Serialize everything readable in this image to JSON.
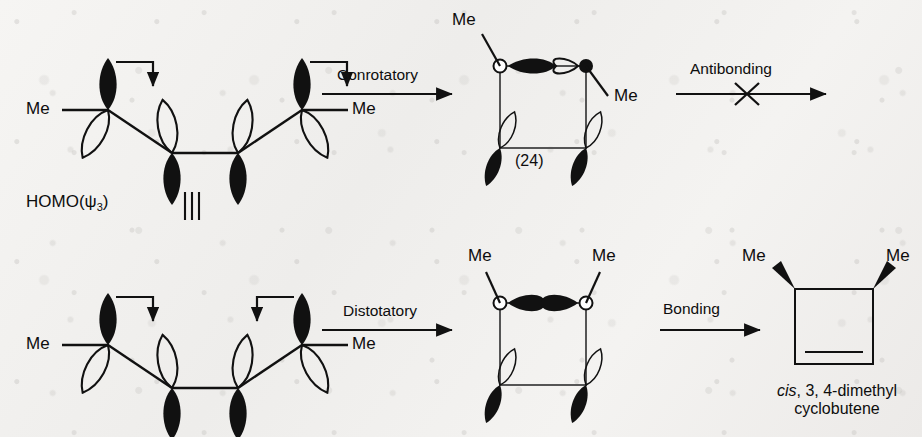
{
  "diagram": {
    "background_color": "#f3f2f0",
    "ink_color": "#111111"
  },
  "labels": {
    "homo": "HOMO(ψ",
    "homo_sub": "3",
    "homo_close": ")",
    "equals_sign": "‖",
    "me": "Me",
    "compound_24": "(24)"
  },
  "rows": [
    {
      "id": "conrotatory-row",
      "rotation_mode": "conrotatory",
      "reactant": {
        "name": "hexadiene-homo-conrotatory",
        "left_methyl": "Me",
        "right_methyl": "Me",
        "arrow_direction_left": "clockwise-right-down",
        "arrow_direction_right": "clockwise-right-down"
      },
      "arrow1_label": "Conrotatory",
      "intermediate": {
        "name": "transition-structure-24",
        "caption": "(24)",
        "top_left_methyl": "Me",
        "top_right_methyl": "Me",
        "overlap": "antibonding"
      },
      "arrow2_label": "Antibonding",
      "arrow2_blocked": true,
      "product": null
    },
    {
      "id": "disrotatory-row",
      "rotation_mode": "disrotatory",
      "reactant": {
        "name": "hexadiene-homo-disrotatory",
        "left_methyl": "Me",
        "right_methyl": "Me",
        "arrow_direction_left": "right-down-inward",
        "arrow_direction_right": "left-down-inward"
      },
      "arrow1_label": "Distotatory",
      "intermediate": {
        "name": "transition-structure-bonding",
        "caption": "",
        "top_left_methyl": "Me",
        "top_right_methyl": "Me",
        "overlap": "bonding"
      },
      "arrow2_label": "Bonding",
      "arrow2_blocked": false,
      "product": {
        "name": "cis-3-4-dimethylcyclobutene",
        "left_methyl": "Me",
        "right_methyl": "Me",
        "caption_italic": "cis",
        "caption_rest": ", 3, 4-dimethyl",
        "caption_line2": "cyclobutene"
      }
    }
  ]
}
